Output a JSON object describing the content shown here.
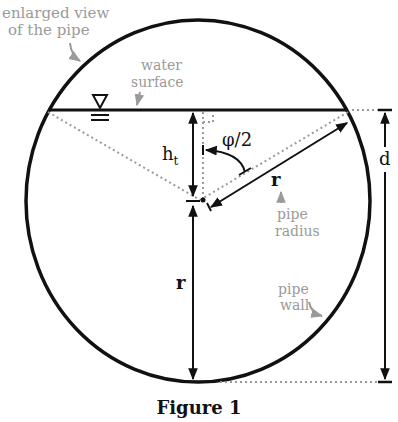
{
  "figure": {
    "caption": "Figure 1",
    "annotations": {
      "enlarged_view_line1": "enlarged view",
      "enlarged_view_line2": "of the pipe",
      "water_surface_line1": "water",
      "water_surface_line2": "surface",
      "pipe_radius_line1": "pipe",
      "pipe_radius_line2": "radius",
      "pipe_wall_line1": "pipe",
      "pipe_wall_line2": "wall"
    },
    "symbols": {
      "height": "h",
      "height_subscript": "t",
      "angle": "φ/2",
      "radius_slanted": "r",
      "radius_vertical": "r",
      "diameter": "d"
    },
    "colors": {
      "line": "#111111",
      "annotation": "#9a9a9a"
    }
  }
}
